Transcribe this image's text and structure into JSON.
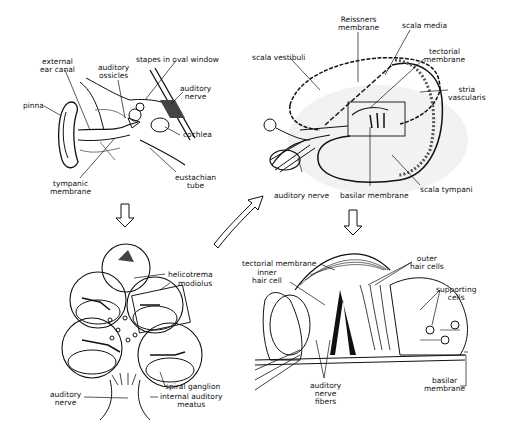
{
  "panels": {
    "outer_ear": {
      "labels": {
        "external_ear_canal": "external\near canal",
        "auditory_ossicles": "auditory\nossicles",
        "stapes": "stapes in oval window",
        "auditory_nerve": "auditory\nnerve",
        "pinna": "pinna",
        "cochlea": "cochlea",
        "tympanic_membrane": "tympanic\nmembrane",
        "eustachian_tube": "eustachian\ntube"
      }
    },
    "cochlea_cross_section": {
      "labels": {
        "reissners_membrane": "Reissners\nmembrane",
        "scala_media": "scala media",
        "scala_vestibuli": "scala vestibuli",
        "tectorial_membrane": "tectorial\nmembrane",
        "stria_vascularis": "stria\nvascularis",
        "auditory_nerve": "auditory nerve",
        "basilar_membrane": "basilar membrane",
        "scala_tympani": "scala tympani"
      }
    },
    "cochlea_spiral": {
      "labels": {
        "helicotrema": "helicotrema",
        "modiolus": "modiolus",
        "auditory_nerve": "auditory\nnerve",
        "spiral_ganglion": "spiral ganglion",
        "internal_auditory_meatus": "internal auditory\nmeatus"
      }
    },
    "organ_of_corti": {
      "labels": {
        "tectorial_membrane": "tectorial membrane",
        "inner_hair_cell": "inner\nhair cell",
        "outer_hair_cells": "outer\nhair cells",
        "supporting_cells": "supporting\ncells",
        "auditory_nerve_fibers": "auditory\nnerve\nfibers",
        "basilar_membrane": "basilar\nmembrane"
      }
    }
  }
}
